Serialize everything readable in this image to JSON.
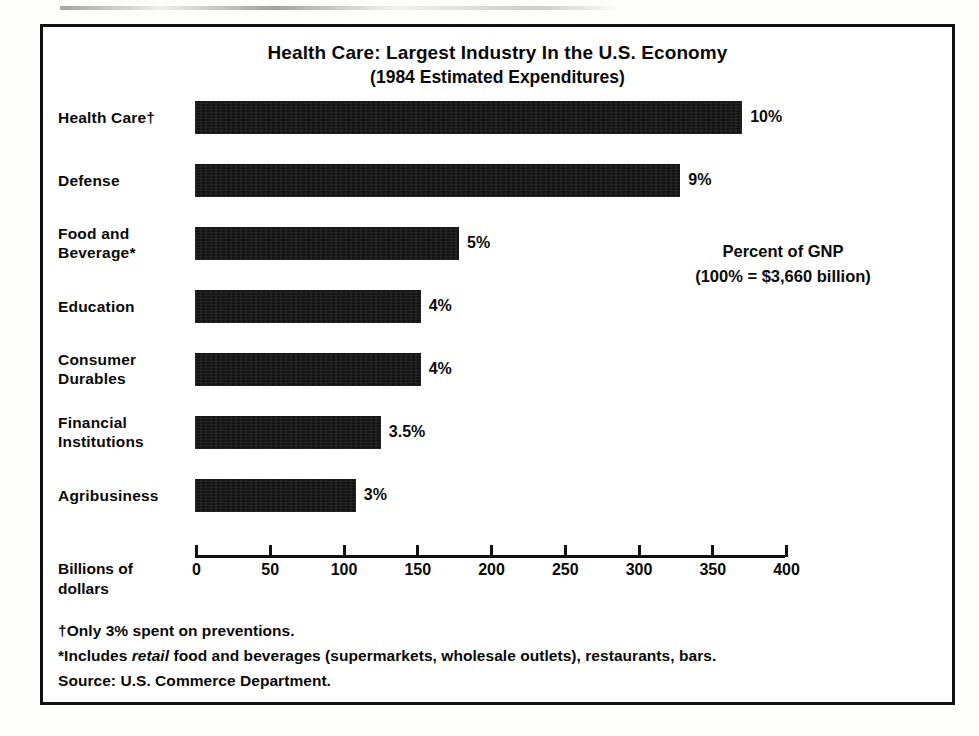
{
  "chart_data": {
    "type": "bar",
    "orientation": "horizontal",
    "title": "Health Care: Largest Industry In the U.S. Economy",
    "subtitle": "(1984 Estimated Expenditures)",
    "xlabel": "Billions of dollars",
    "ylabel": "",
    "xlim": [
      0,
      400
    ],
    "grid": false,
    "legend": null,
    "categories": [
      "Health Care†",
      "Defense",
      "Food and Beverage*",
      "Education",
      "Consumer Durables",
      "Financial Institutions",
      "Agribusiness"
    ],
    "values": [
      371,
      329,
      179,
      153,
      153,
      126,
      109
    ],
    "value_unit": "billions of dollars",
    "data_labels": [
      "10%",
      "9%",
      "5%",
      "4%",
      "4%",
      "3.5%",
      "3%"
    ],
    "data_label_unit": "percent of GNP",
    "xticks": [
      0,
      50,
      100,
      150,
      200,
      250,
      300,
      350,
      400
    ],
    "xtick_labels": [
      "0",
      "50",
      "100",
      "150",
      "200",
      "250",
      "300",
      "350",
      "400"
    ],
    "annotations": [
      "Percent of GNP",
      "(100%  =  $3,660 billion)"
    ],
    "footnotes": [
      "†Only 3% spent on preventions.",
      "*Includes retail food and beverages (supermarkets, wholesale outlets), restaurants, bars.",
      "Source: U.S. Commerce Department."
    ],
    "colors": {
      "bar": "#141414",
      "background": "#ffffff",
      "text": "#0a0a0a",
      "frame": "#111111"
    }
  },
  "chart": {
    "title": "Health Care: Largest Industry In the U.S. Economy",
    "subtitle": "(1984 Estimated Expenditures)",
    "axis_title_line1": "Billions of",
    "axis_title_line2": "dollars",
    "annotation_line1": "Percent of GNP",
    "annotation_line2": "(100%  =  $3,660 billion)",
    "rows": [
      {
        "label_line1": "Health Care†",
        "label_line2": "",
        "value": 371,
        "data_label": "10%"
      },
      {
        "label_line1": "Defense",
        "label_line2": "",
        "value": 329,
        "data_label": "9%"
      },
      {
        "label_line1": "Food and",
        "label_line2": "Beverage*",
        "value": 179,
        "data_label": "5%"
      },
      {
        "label_line1": "Education",
        "label_line2": "",
        "value": 153,
        "data_label": "4%"
      },
      {
        "label_line1": "Consumer",
        "label_line2": "Durables",
        "value": 153,
        "data_label": "4%"
      },
      {
        "label_line1": "Financial",
        "label_line2": "Institutions",
        "value": 126,
        "data_label": "3.5%"
      },
      {
        "label_line1": "Agribusiness",
        "label_line2": "",
        "value": 109,
        "data_label": "3%"
      }
    ],
    "xticks": [
      "0",
      "50",
      "100",
      "150",
      "200",
      "250",
      "300",
      "350",
      "400"
    ],
    "footnotes": {
      "line1": "†Only 3% spent on preventions.",
      "line2_prefix": "*Includes ",
      "line2_italic": "retail",
      "line2_suffix": " food and beverages (supermarkets, wholesale outlets), restaurants, bars.",
      "line3": "Source: U.S. Commerce Department."
    }
  }
}
